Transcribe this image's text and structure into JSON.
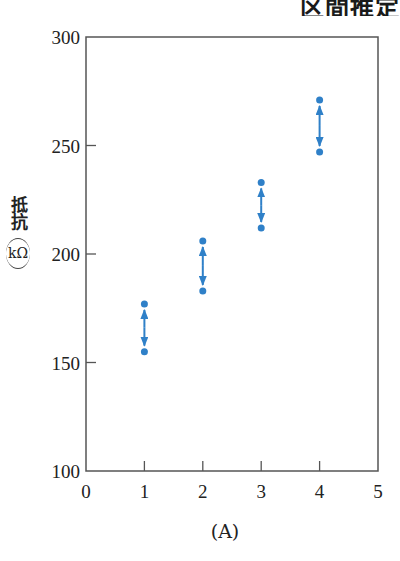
{
  "title_fragment": "区間推定",
  "chart_data": {
    "type": "scatter",
    "title": "区間推定",
    "xlabel": "(A)",
    "ylabel": "抵抗 (kΩ)",
    "ylabel_main": "抵抗",
    "ylabel_unit": "kΩ",
    "xlim": [
      0,
      5
    ],
    "ylim": [
      100,
      300
    ],
    "xticks": [
      0,
      1,
      2,
      3,
      4,
      5
    ],
    "yticks": [
      100,
      150,
      200,
      250,
      300
    ],
    "grid": false,
    "series": [
      {
        "name": "interval",
        "color": "#2f80c8",
        "points": [
          {
            "x": 1,
            "upper": 177,
            "lower": 155
          },
          {
            "x": 2,
            "upper": 206,
            "lower": 183
          },
          {
            "x": 3,
            "upper": 233,
            "lower": 212
          },
          {
            "x": 4,
            "upper": 271,
            "lower": 247
          }
        ]
      }
    ]
  },
  "colors": {
    "series": "#2f80c8",
    "axis": "#555555"
  }
}
